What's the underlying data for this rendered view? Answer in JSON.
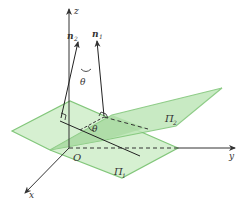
{
  "figure": {
    "colors": {
      "plane_fill": "#c9ecc4",
      "plane_overlap_fill": "#a9dca3",
      "plane_stroke": "#7cc474",
      "axis": "#333333",
      "line": "#222222"
    },
    "labels": {
      "z_axis": "z",
      "x_axis": "x",
      "y_axis": "y",
      "origin": "O",
      "normal_2": "n",
      "normal_2_sub": "2",
      "normal_1": "n",
      "normal_1_sub": "1",
      "angle_top": "θ",
      "angle_bottom": "θ",
      "plane_1": "Π",
      "plane_1_sub": "1",
      "plane_2": "Π",
      "plane_2_sub": "2"
    }
  }
}
